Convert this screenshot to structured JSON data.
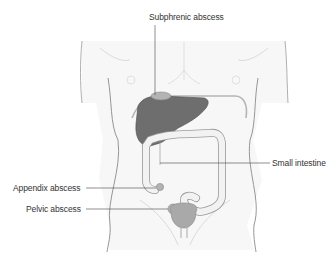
{
  "diagram": {
    "labels": {
      "subphrenic": "Subphrenic abscess",
      "small_intestine": "Small intestine",
      "appendix": "Appendix abscess",
      "pelvic": "Pelvic abscess"
    },
    "colors": {
      "background": "#ffffff",
      "body_fill": "#f7f7f7",
      "body_outline": "#8a8a8a",
      "liver": "#6e6e6e",
      "liver_outline": "#555555",
      "abscess": "#b3b3b3",
      "bowel_fill": "#f2f2f2",
      "bowel_outline": "#9a9a9a",
      "bladder": "#a9a9a9",
      "leader_line": "#444444",
      "text": "#333333"
    }
  }
}
